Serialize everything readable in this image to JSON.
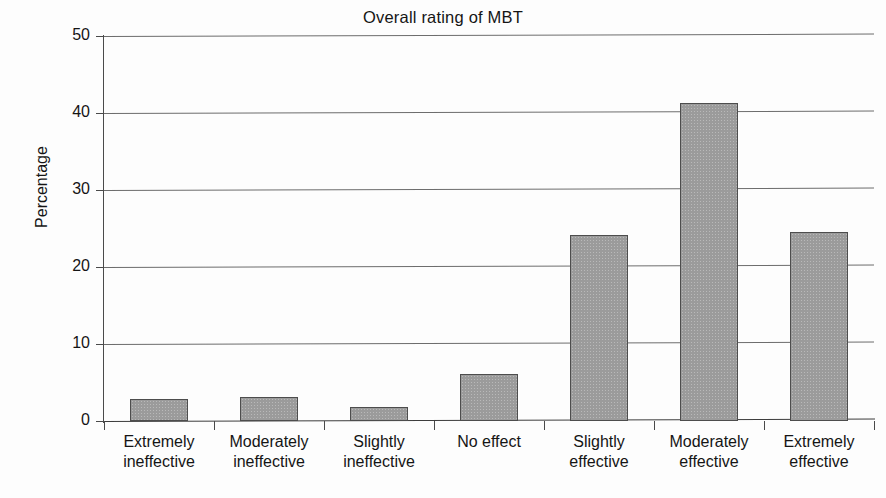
{
  "chart_data": {
    "type": "bar",
    "title": "Overall rating of MBT",
    "xlabel": "",
    "ylabel": "Percentage",
    "ylim": [
      0,
      50
    ],
    "yticks": [
      0,
      10,
      20,
      30,
      40,
      50
    ],
    "ytick_labels": [
      "0",
      "10",
      "20",
      "30",
      "40",
      "50"
    ],
    "grid": true,
    "legend": null,
    "categories": [
      "Extremely ineffective",
      "Moderately ineffective",
      "Slightly ineffective",
      "No effect",
      "Slightly effective",
      "Moderately effective",
      "Extremely effective"
    ],
    "category_lines": [
      [
        "Extremely",
        "ineffective"
      ],
      [
        "Moderately",
        "ineffective"
      ],
      [
        "Slightly",
        "ineffective"
      ],
      [
        "No effect",
        ""
      ],
      [
        "Slightly",
        "effective"
      ],
      [
        "Moderately",
        "effective"
      ],
      [
        "Extremely",
        "effective"
      ]
    ],
    "values": [
      2.9,
      3.1,
      1.8,
      6.1,
      24.2,
      41.3,
      24.5
    ],
    "bar_color": "#9b9b9b",
    "bar_edge_color": "#4d4d4d",
    "axis_color": "#4a4a4a",
    "grid_color": "#6d6d6d"
  }
}
